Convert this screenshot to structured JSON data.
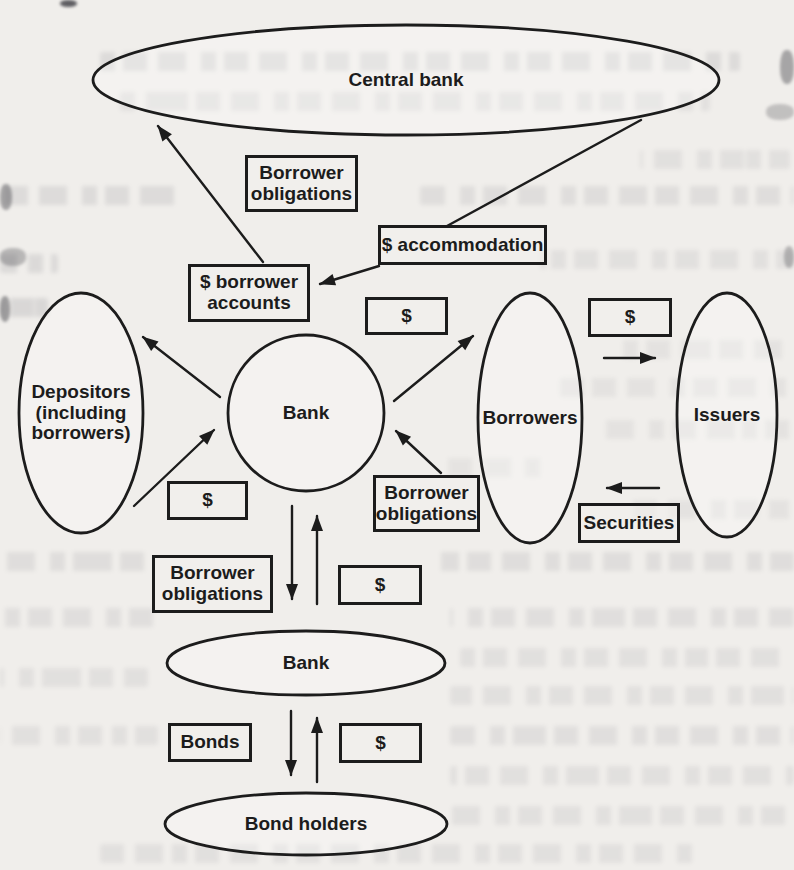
{
  "figure": {
    "type": "flow-diagram",
    "colors": {
      "ink": "#1c1c1c",
      "paper": "#f0eeeb"
    },
    "nodes": [
      {
        "id": "central-bank",
        "shape": "ellipse",
        "label": "Central bank"
      },
      {
        "id": "depositors",
        "shape": "ellipse",
        "label": "Depositors (including borrowers)"
      },
      {
        "id": "bank-upper",
        "shape": "circle",
        "label": "Bank"
      },
      {
        "id": "borrowers",
        "shape": "ellipse",
        "label": "Borrowers"
      },
      {
        "id": "issuers",
        "shape": "ellipse",
        "label": "Issuers"
      },
      {
        "id": "bank-lower",
        "shape": "ellipse",
        "label": "Bank"
      },
      {
        "id": "bond-holders",
        "shape": "ellipse",
        "label": "Bond holders"
      }
    ],
    "flow_labels": [
      {
        "id": "borrower-obligations-top",
        "label": "Borrower obligations"
      },
      {
        "id": "accommodation",
        "label": "$ accommodation"
      },
      {
        "id": "borrower-accounts",
        "label": "$ borrower accounts"
      },
      {
        "id": "dollar-mid",
        "label": "$"
      },
      {
        "id": "dollar-right",
        "label": "$"
      },
      {
        "id": "dollar-left",
        "label": "$"
      },
      {
        "id": "borrower-obligations-mid",
        "label": "Borrower obligations"
      },
      {
        "id": "borrower-obligations-lower",
        "label": "Borrower obligations"
      },
      {
        "id": "dollar-lower",
        "label": "$"
      },
      {
        "id": "securities",
        "label": "Securities"
      },
      {
        "id": "bonds",
        "label": "Bonds"
      },
      {
        "id": "dollar-bottom",
        "label": "$"
      }
    ],
    "edges": [
      {
        "from": "borrower-accounts",
        "to": "central-bank",
        "arrow": true,
        "label_box": "borrower-obligations-top"
      },
      {
        "from": "central-bank",
        "to": "accommodation",
        "arrow": false
      },
      {
        "from": "accommodation",
        "to": "borrower-accounts",
        "arrow": true
      },
      {
        "from": "bank-upper",
        "to": "depositors",
        "arrow": true
      },
      {
        "from": "depositors",
        "to": "bank-upper",
        "arrow": true,
        "label_box": "dollar-left"
      },
      {
        "from": "bank-upper",
        "to": "borrowers",
        "arrow": true,
        "label_box": "dollar-mid"
      },
      {
        "from": "borrower-obligations-mid",
        "to": "bank-upper",
        "arrow": true
      },
      {
        "from": "borrowers",
        "to": "issuers",
        "arrow": true,
        "label_box": "dollar-right"
      },
      {
        "from": "issuers",
        "to": "borrowers",
        "arrow": true,
        "label_box": "securities"
      },
      {
        "from": "bank-upper",
        "to": "bank-lower",
        "arrow": true,
        "label_box": "borrower-obligations-lower"
      },
      {
        "from": "bank-lower",
        "to": "bank-upper",
        "arrow": true,
        "label_box": "dollar-lower"
      },
      {
        "from": "bank-lower",
        "to": "bond-holders",
        "arrow": true,
        "label_box": "bonds"
      },
      {
        "from": "bond-holders",
        "to": "bank-lower",
        "arrow": true,
        "label_box": "dollar-bottom"
      }
    ]
  }
}
